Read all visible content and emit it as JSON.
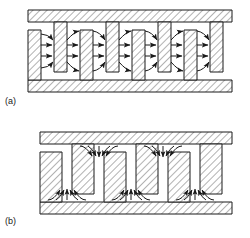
{
  "figure": {
    "type": "technical-cross-section-diagram",
    "panels": [
      {
        "id": "a",
        "label": "(a)",
        "mode": "horizontal-field",
        "description": "Interdigitated T-shaped fingers alternating from top and bottom hatched bars; electric field lines run horizontally across each gap from left finger to right finger",
        "electrode_count": 8,
        "gap_count": 7,
        "field_lines_per_gap": 4,
        "field_line_pattern": [
          "curved-down",
          "straight",
          "straight",
          "curved-up"
        ],
        "field_direction": "left-to-right",
        "bounds": {
          "x": 28,
          "y": 10,
          "width": 204,
          "height": 82
        },
        "top_bar": {
          "y": 10,
          "height": 12
        },
        "bottom_bar": {
          "y": 80,
          "height": 12
        },
        "finger_width": 13,
        "finger_height": 50,
        "period": 26
      },
      {
        "id": "b",
        "label": "(b)",
        "mode": "vertical-field",
        "description": "Full-height hatched columns separated by narrow gaps; electric field arrows fan inward and converge into the narrow gaps at the top and the bottom surfaces",
        "column_count": 6,
        "gap_count": 5,
        "arrow_fans_top": 2,
        "arrow_fans_bottom": 3,
        "arrows_per_fan": 5,
        "field_direction": "converging-into-gap",
        "bounds": {
          "x": 40,
          "y": 132,
          "width": 192,
          "height": 82
        },
        "top_bar": {
          "y": 132,
          "height": 12
        },
        "bottom_bar": {
          "y": 202,
          "height": 12
        },
        "column_width": 22,
        "gap_width": 10,
        "period": 32
      }
    ]
  },
  "style": {
    "line_color": "#1a1a1a",
    "hatch_color": "#555555",
    "fill_color": "#ffffff",
    "background": "#ffffff",
    "hatch_angle_deg": 45,
    "hatch_spacing_px": 5,
    "stroke_width": 1
  }
}
